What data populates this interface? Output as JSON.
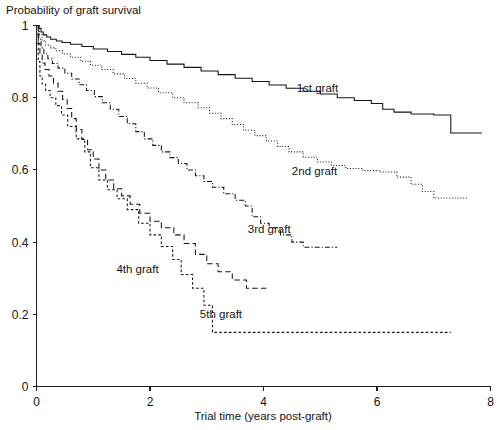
{
  "chart_data": {
    "type": "line",
    "title": "Probability of graft survival",
    "xlabel": "Trial time (years post-graft)",
    "ylabel": "",
    "xlim": [
      0,
      8
    ],
    "ylim": [
      0,
      1
    ],
    "grid": false,
    "legend_position": "inline-annotations",
    "xticks": [
      "0",
      "2",
      "4",
      "6",
      "8"
    ],
    "xtick_values": [
      0,
      2,
      4,
      6,
      8
    ],
    "yticks": [
      "0",
      "0.2",
      "0.4",
      "0.6",
      "0.8",
      "1"
    ],
    "ytick_values": [
      0,
      0.2,
      0.4,
      0.6,
      0.8,
      1
    ],
    "curve_type": "kaplan-meier-step",
    "series": [
      {
        "name": "1st graft",
        "label": "1st graft",
        "line_style": "solid",
        "label_x": 4.95,
        "label_y": 0.815,
        "points": [
          [
            0.0,
            1.0
          ],
          [
            0.04,
            0.992
          ],
          [
            0.08,
            0.982
          ],
          [
            0.12,
            0.974
          ],
          [
            0.18,
            0.968
          ],
          [
            0.25,
            0.962
          ],
          [
            0.35,
            0.957
          ],
          [
            0.45,
            0.953
          ],
          [
            0.6,
            0.948
          ],
          [
            0.8,
            0.942
          ],
          [
            1.0,
            0.935
          ],
          [
            1.25,
            0.928
          ],
          [
            1.5,
            0.92
          ],
          [
            1.75,
            0.912
          ],
          [
            2.0,
            0.903
          ],
          [
            2.3,
            0.893
          ],
          [
            2.6,
            0.884
          ],
          [
            2.9,
            0.874
          ],
          [
            3.2,
            0.864
          ],
          [
            3.5,
            0.854
          ],
          [
            3.8,
            0.845
          ],
          [
            4.1,
            0.835
          ],
          [
            4.4,
            0.826
          ],
          [
            4.7,
            0.818
          ],
          [
            5.0,
            0.81
          ],
          [
            5.3,
            0.8
          ],
          [
            5.6,
            0.792
          ],
          [
            5.9,
            0.784
          ],
          [
            6.1,
            0.768
          ],
          [
            6.3,
            0.76
          ],
          [
            6.6,
            0.755
          ],
          [
            7.0,
            0.752
          ],
          [
            7.3,
            0.702
          ],
          [
            7.85,
            0.702
          ]
        ]
      },
      {
        "name": "2nd graft",
        "label": "2nd graft",
        "line_style": "dotted",
        "label_x": 4.9,
        "label_y": 0.585,
        "points": [
          [
            0.0,
            1.0
          ],
          [
            0.05,
            0.975
          ],
          [
            0.1,
            0.958
          ],
          [
            0.16,
            0.946
          ],
          [
            0.24,
            0.938
          ],
          [
            0.34,
            0.93
          ],
          [
            0.46,
            0.921
          ],
          [
            0.6,
            0.912
          ],
          [
            0.78,
            0.901
          ],
          [
            0.95,
            0.89
          ],
          [
            1.15,
            0.878
          ],
          [
            1.35,
            0.866
          ],
          [
            1.55,
            0.853
          ],
          [
            1.75,
            0.84
          ],
          [
            1.95,
            0.827
          ],
          [
            2.15,
            0.814
          ],
          [
            2.4,
            0.8
          ],
          [
            2.6,
            0.786
          ],
          [
            2.85,
            0.772
          ],
          [
            3.05,
            0.757
          ],
          [
            3.25,
            0.742
          ],
          [
            3.45,
            0.726
          ],
          [
            3.65,
            0.71
          ],
          [
            3.85,
            0.695
          ],
          [
            4.05,
            0.68
          ],
          [
            4.25,
            0.665
          ],
          [
            4.45,
            0.65
          ],
          [
            4.7,
            0.635
          ],
          [
            4.95,
            0.622
          ],
          [
            5.2,
            0.612
          ],
          [
            5.45,
            0.604
          ],
          [
            5.75,
            0.598
          ],
          [
            6.05,
            0.594
          ],
          [
            6.35,
            0.58
          ],
          [
            6.6,
            0.56
          ],
          [
            6.8,
            0.54
          ],
          [
            7.0,
            0.522
          ],
          [
            7.6,
            0.522
          ]
        ]
      },
      {
        "name": "3rd graft",
        "label": "3rd graft",
        "line_style": "dash-dot",
        "label_x": 4.1,
        "label_y": 0.425,
        "points": [
          [
            0.0,
            1.0
          ],
          [
            0.04,
            0.962
          ],
          [
            0.08,
            0.938
          ],
          [
            0.13,
            0.922
          ],
          [
            0.2,
            0.908
          ],
          [
            0.28,
            0.895
          ],
          [
            0.38,
            0.882
          ],
          [
            0.5,
            0.868
          ],
          [
            0.62,
            0.852
          ],
          [
            0.75,
            0.836
          ],
          [
            0.88,
            0.82
          ],
          [
            1.02,
            0.803
          ],
          [
            1.16,
            0.786
          ],
          [
            1.3,
            0.768
          ],
          [
            1.45,
            0.748
          ],
          [
            1.6,
            0.728
          ],
          [
            1.75,
            0.706
          ],
          [
            1.9,
            0.686
          ],
          [
            2.05,
            0.668
          ],
          [
            2.2,
            0.65
          ],
          [
            2.35,
            0.634
          ],
          [
            2.5,
            0.618
          ],
          [
            2.65,
            0.6
          ],
          [
            2.8,
            0.584
          ],
          [
            2.95,
            0.568
          ],
          [
            3.1,
            0.552
          ],
          [
            3.3,
            0.534
          ],
          [
            3.5,
            0.516
          ],
          [
            3.68,
            0.5
          ],
          [
            3.8,
            0.47
          ],
          [
            3.95,
            0.452
          ],
          [
            4.1,
            0.44
          ],
          [
            4.3,
            0.42
          ],
          [
            4.5,
            0.4
          ],
          [
            4.7,
            0.386
          ],
          [
            5.3,
            0.386
          ]
        ]
      },
      {
        "name": "4th graft",
        "label": "4th graft",
        "line_style": "dashed",
        "label_x": 1.78,
        "label_y": 0.315,
        "points": [
          [
            0.0,
            1.0
          ],
          [
            0.03,
            0.95
          ],
          [
            0.06,
            0.918
          ],
          [
            0.1,
            0.896
          ],
          [
            0.15,
            0.878
          ],
          [
            0.22,
            0.86
          ],
          [
            0.3,
            0.84
          ],
          [
            0.38,
            0.818
          ],
          [
            0.46,
            0.795
          ],
          [
            0.54,
            0.77
          ],
          [
            0.62,
            0.742
          ],
          [
            0.7,
            0.712
          ],
          [
            0.8,
            0.684
          ],
          [
            0.9,
            0.656
          ],
          [
            1.0,
            0.63
          ],
          [
            1.1,
            0.6
          ],
          [
            1.22,
            0.572
          ],
          [
            1.36,
            0.548
          ],
          [
            1.5,
            0.528
          ],
          [
            1.65,
            0.505
          ],
          [
            1.82,
            0.48
          ],
          [
            2.0,
            0.458
          ],
          [
            2.2,
            0.44
          ],
          [
            2.42,
            0.42
          ],
          [
            2.6,
            0.396
          ],
          [
            2.8,
            0.366
          ],
          [
            3.0,
            0.34
          ],
          [
            3.2,
            0.318
          ],
          [
            3.45,
            0.295
          ],
          [
            3.7,
            0.272
          ],
          [
            4.05,
            0.272
          ]
        ]
      },
      {
        "name": "5th graft",
        "label": "5th graft",
        "line_style": "fine-dashed",
        "label_x": 3.25,
        "label_y": 0.19,
        "points": [
          [
            0.0,
            1.0
          ],
          [
            0.03,
            0.9
          ],
          [
            0.06,
            0.86
          ],
          [
            0.1,
            0.838
          ],
          [
            0.16,
            0.82
          ],
          [
            0.24,
            0.8
          ],
          [
            0.34,
            0.778
          ],
          [
            0.44,
            0.752
          ],
          [
            0.55,
            0.72
          ],
          [
            0.7,
            0.686
          ],
          [
            0.85,
            0.65
          ],
          [
            0.95,
            0.606
          ],
          [
            1.1,
            0.572
          ],
          [
            1.25,
            0.545
          ],
          [
            1.42,
            0.52
          ],
          [
            1.6,
            0.49
          ],
          [
            1.8,
            0.452
          ],
          [
            2.0,
            0.42
          ],
          [
            2.2,
            0.388
          ],
          [
            2.4,
            0.352
          ],
          [
            2.55,
            0.31
          ],
          [
            2.75,
            0.272
          ],
          [
            2.95,
            0.225
          ],
          [
            3.1,
            0.15
          ],
          [
            7.3,
            0.15
          ]
        ]
      }
    ]
  },
  "axes": {
    "title": "Probability of graft survival",
    "x_axis_label": "Trial time (years post-graft)"
  }
}
